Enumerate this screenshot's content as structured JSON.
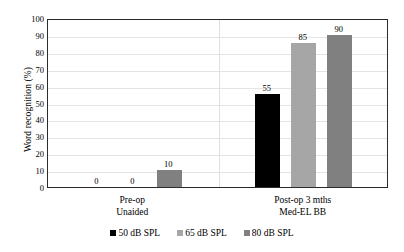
{
  "chart_data": {
    "type": "bar",
    "title": "",
    "xlabel": "",
    "ylabel": "Word recognition (%)",
    "ylim": [
      0,
      100
    ],
    "ytick_step": 10,
    "yticks": [
      100,
      90,
      80,
      70,
      60,
      50,
      40,
      30,
      20,
      10,
      0
    ],
    "grid": true,
    "legend_position": "bottom",
    "categories": [
      {
        "line1": "Pre-op",
        "line2": "Unaided"
      },
      {
        "line1": "Post-op 3 mths",
        "line2": "Med-EL BB"
      }
    ],
    "series": [
      {
        "name": "50 dB SPL",
        "color": "#000000",
        "values": [
          0,
          55
        ]
      },
      {
        "name": "65 dB SPL",
        "color": "#a6a6a6",
        "values": [
          0,
          85
        ]
      },
      {
        "name": "80 dB SPL",
        "color": "#808080",
        "values": [
          10,
          90
        ]
      }
    ],
    "data_labels": {
      "pre_op": [
        "0",
        "0",
        "10"
      ],
      "post_op": [
        "55",
        "85",
        "90"
      ]
    }
  },
  "colors": {
    "axis": "#2b2b2b",
    "gridline": "#e4e4e4",
    "background": "#ffffff",
    "text": "#000000"
  }
}
